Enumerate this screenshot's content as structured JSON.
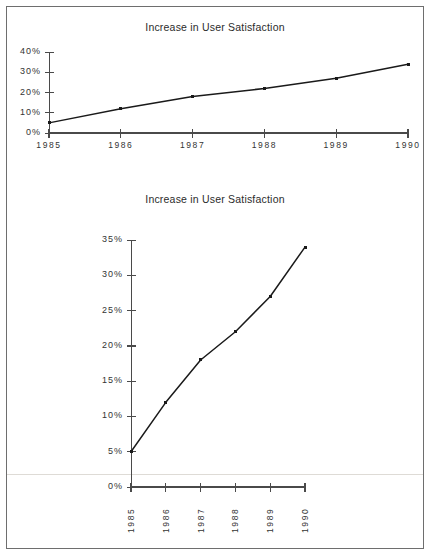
{
  "document": {
    "kind": "two-panel-line-chart-figure",
    "panels": 2
  },
  "chart_data": [
    {
      "id": "top-chart",
      "type": "line",
      "title": "Increase in User Satisfaction",
      "xlabel": "",
      "ylabel": "",
      "categories": [
        "1985",
        "1986",
        "1987",
        "1988",
        "1989",
        "1990"
      ],
      "values": [
        5,
        12,
        18,
        22,
        27,
        34
      ],
      "ylim": [
        0,
        40
      ],
      "yticks": [
        0,
        10,
        20,
        30,
        40
      ],
      "ytick_labels": [
        "0%",
        "10%",
        "20%",
        "30%",
        "40%"
      ],
      "xtick_labels": [
        "1985",
        "1986",
        "1987",
        "1988",
        "1989",
        "1990"
      ],
      "xtick_orientation": "horizontal",
      "grid": false,
      "legend": false,
      "marker": "square",
      "line_color": "#1a1a1a",
      "axis_color": "#4a4a4a"
    },
    {
      "id": "bottom-chart",
      "type": "line",
      "title": "Increase in User Satisfaction",
      "xlabel": "",
      "ylabel": "",
      "categories": [
        "1985",
        "1986",
        "1987",
        "1988",
        "1989",
        "1990"
      ],
      "values": [
        5,
        12,
        18,
        22,
        27,
        34
      ],
      "ylim": [
        0,
        35
      ],
      "yticks": [
        0,
        5,
        10,
        15,
        20,
        25,
        30,
        35
      ],
      "ytick_labels": [
        "0%",
        "5%",
        "10%",
        "15%",
        "20%",
        "25%",
        "30%",
        "35%"
      ],
      "xtick_labels": [
        "1985",
        "1986",
        "1987",
        "1988",
        "1989",
        "1990"
      ],
      "xtick_orientation": "vertical",
      "grid": false,
      "legend": false,
      "marker": "square",
      "line_color": "#1a1a1a",
      "axis_color": "#4a4a4a"
    }
  ],
  "colors": {
    "page_background": "#ffffff",
    "border": "#6e6e6e",
    "ink": "#1a1a1a",
    "axis": "#4a4a4a",
    "label": "#333333",
    "scan_artifact": "#dedbd6"
  }
}
